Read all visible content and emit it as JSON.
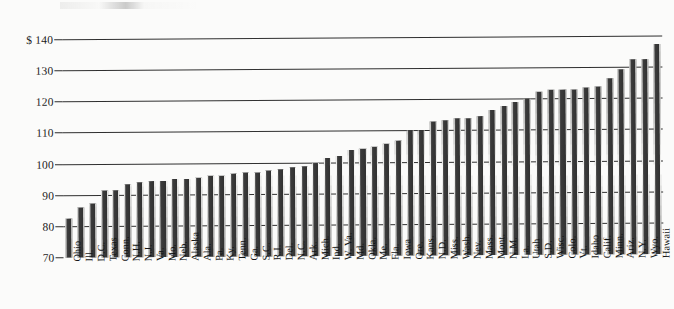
{
  "chart_data": {
    "type": "bar",
    "title": "",
    "subtitle": "",
    "xlabel": "",
    "ylabel": "",
    "ylim": [
      70,
      140
    ],
    "grid": true,
    "legend": null,
    "y_axis_prefix": "$",
    "y_tick_labels": [
      "$ 140",
      "130",
      "120",
      "110",
      "100",
      "90",
      "80",
      "70"
    ],
    "y_ticks": [
      140,
      130,
      120,
      110,
      100,
      90,
      80,
      70
    ],
    "categories": [
      "Ohio",
      "Ill.",
      "D.C.",
      "Texas",
      "Conn.",
      "N.H.",
      "N.J.",
      "Va.",
      "Mo.",
      "Neb.",
      "Alaska",
      "Ala.",
      "Pa.",
      "Ky.",
      "Tenn.",
      "Ga.",
      "S.C.",
      "R.I.",
      "Del.",
      "N.C.",
      "Ark.",
      "Mich.",
      "Ind.",
      "W. Va.",
      "Md.",
      "Okla.",
      "Me.",
      "Fla.",
      "Iowa",
      "Ore.",
      "Kans.",
      "N.D.",
      "Miss.",
      "Wash.",
      "Nev.",
      "Mass.",
      "Mont.",
      "N.M.",
      "La.",
      "Utah",
      "S.D.",
      "Wisc.",
      "Colo.",
      "Vt.",
      "Idaho",
      "Calif.",
      "Minn.",
      "Ariz.",
      "N.Y.",
      "Wyo.",
      "Hawaii"
    ],
    "values": [
      82.5,
      86,
      87.5,
      91.5,
      91.5,
      93.5,
      94,
      94.5,
      94.5,
      95,
      95,
      95.5,
      96,
      96,
      96.5,
      97,
      97,
      97.5,
      98,
      98.5,
      99,
      100,
      101.5,
      102,
      104,
      104.5,
      105,
      106,
      107,
      110,
      110,
      113,
      113.5,
      114,
      114,
      114.5,
      116.5,
      118,
      119,
      120,
      122.5,
      123,
      123,
      123,
      123.5,
      124,
      126.5,
      129.5,
      132.5,
      132.5,
      137.5
    ]
  }
}
